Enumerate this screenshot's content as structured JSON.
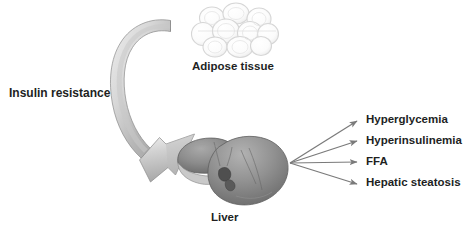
{
  "figure": {
    "width": 467,
    "height": 232,
    "background": "#ffffff",
    "text_color": "#221f1f"
  },
  "labels": {
    "insulin_resistance": "Insulin resistance",
    "adipose_tissue": "Adipose tissue",
    "liver": "Liver"
  },
  "outputs": [
    {
      "label": "Hyperglycemia"
    },
    {
      "label": "Hyperinsulinemia"
    },
    {
      "label": "FFA"
    },
    {
      "label": "Hepatic steatosis"
    }
  ],
  "colors": {
    "arrow_stroke": "#7a7a7a",
    "curved_arrow_fill_light": "#e3e3e3",
    "curved_arrow_fill_dark": "#9e9e9e",
    "curved_arrow_outline": "#8c8c8c",
    "liver_dark": "#6f6f6f",
    "liver_mid": "#8f8f8f",
    "liver_light": "#b4b4b4",
    "adipose_outline": "#d2d2d2",
    "adipose_fill": "#fbfbfb"
  },
  "graphics": {
    "curved_arrow": {
      "name": "insulin-resistance-to-liver-arrow",
      "description": "thick curved 3D ribbon arrow sweeping from upper right, around the left, down to the liver"
    },
    "adipose_tissue_image": {
      "name": "adipose-tissue-illustration",
      "cell_count": 9
    },
    "liver_image": {
      "name": "liver-illustration"
    },
    "output_arrows": {
      "origin_x": 290,
      "origin_y": 163,
      "tips": [
        {
          "x": 361,
          "y": 120
        },
        {
          "x": 361,
          "y": 141
        },
        {
          "x": 361,
          "y": 162
        },
        {
          "x": 361,
          "y": 184
        }
      ]
    }
  }
}
